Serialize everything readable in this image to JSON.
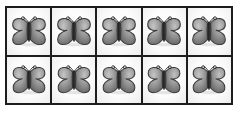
{
  "figure": {
    "kind": "image-grid",
    "object_name": "butterfly",
    "icon_name": "butterfly-icon",
    "rows": 2,
    "columns": 5,
    "total_count": 10
  },
  "colors": {
    "page_background": "#ffffff",
    "frame_border": "#1d1d1d",
    "cell_background": "#fcfcfc",
    "cell_divider": "#1d1d1d",
    "butterfly_wing_light": "#b9b9b9",
    "butterfly_wing_mid": "#8f8f8f",
    "butterfly_wing_dark": "#6a6a6a",
    "butterfly_outline": "#3a3a3a",
    "butterfly_body": "#2e2e2e",
    "shadow": "#c8c8c8"
  },
  "cells": [
    {
      "row": 1,
      "column": 1,
      "item": "butterfly"
    },
    {
      "row": 1,
      "column": 2,
      "item": "butterfly"
    },
    {
      "row": 1,
      "column": 3,
      "item": "butterfly"
    },
    {
      "row": 1,
      "column": 4,
      "item": "butterfly"
    },
    {
      "row": 1,
      "column": 5,
      "item": "butterfly"
    },
    {
      "row": 2,
      "column": 1,
      "item": "butterfly"
    },
    {
      "row": 2,
      "column": 2,
      "item": "butterfly"
    },
    {
      "row": 2,
      "column": 3,
      "item": "butterfly"
    },
    {
      "row": 2,
      "column": 4,
      "item": "butterfly"
    },
    {
      "row": 2,
      "column": 5,
      "item": "butterfly"
    }
  ]
}
